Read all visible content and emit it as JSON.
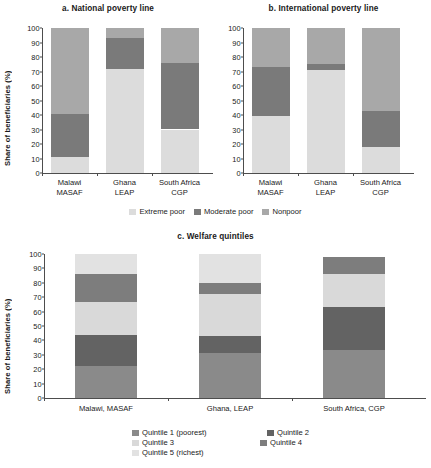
{
  "figure": {
    "ylabel": "Share of beneficiaries (%)",
    "yticks": [
      0,
      10,
      20,
      30,
      40,
      50,
      60,
      70,
      80,
      90,
      100
    ]
  },
  "colors": {
    "extreme_poor": "#dcdcdc",
    "moderate_poor": "#7a7a7a",
    "nonpoor": "#a8a8a8",
    "quintile1": "#8a8a8a",
    "quintile2": "#636363",
    "quintile3": "#d9d9d9",
    "quintile4": "#7d7d7d",
    "quintile5": "#e2e2e2",
    "axis": "#4d4d4d",
    "text": "#1a1a1a"
  },
  "poverty_legend": {
    "items": [
      {
        "label": "Extreme poor",
        "color_key": "extreme_poor"
      },
      {
        "label": "Moderate poor",
        "color_key": "moderate_poor"
      },
      {
        "label": "Nonpoor",
        "color_key": "nonpoor"
      }
    ]
  },
  "quintile_legend": {
    "items": [
      {
        "label": "Quintile 1 (poorest)",
        "color_key": "quintile1"
      },
      {
        "label": "Quintile 2",
        "color_key": "quintile2"
      },
      {
        "label": "Quintile 3",
        "color_key": "quintile3"
      },
      {
        "label": "Quintile 4",
        "color_key": "quintile4"
      },
      {
        "label": "Quintile 5 (richest)",
        "color_key": "quintile5"
      }
    ]
  },
  "chart_data": [
    {
      "type": "bar",
      "stacked": true,
      "panel": "a",
      "title": "a. National poverty line",
      "categories": [
        "Malawi\nMASAF",
        "Ghana\nLEAP",
        "South Africa\nCGP"
      ],
      "category_lines": [
        [
          "Malawi",
          "MASAF"
        ],
        [
          "Ghana",
          "LEAP"
        ],
        [
          "South Africa",
          "CGP"
        ]
      ],
      "series": [
        {
          "name": "Extreme poor",
          "values": [
            11,
            72,
            30
          ]
        },
        {
          "name": "Moderate poor",
          "values": [
            30,
            21,
            46
          ]
        },
        {
          "name": "Nonpoor",
          "values": [
            59,
            7,
            24
          ]
        }
      ],
      "xlabel": "",
      "ylabel": "Share of beneficiaries (%)",
      "ylim": [
        0,
        100
      ],
      "ytick_step": 10,
      "grid": false,
      "legend_position": "bottom"
    },
    {
      "type": "bar",
      "stacked": true,
      "panel": "b",
      "title": "b. International poverty line",
      "categories": [
        "Malawi\nMASAF",
        "Ghana\nLEAP",
        "South Africa\nCGP"
      ],
      "category_lines": [
        [
          "Malawi",
          "MASAF"
        ],
        [
          "Ghana",
          "LEAP"
        ],
        [
          "South Africa",
          "CGP"
        ]
      ],
      "series": [
        {
          "name": "Extreme poor",
          "values": [
            39,
            71,
            18
          ]
        },
        {
          "name": "Moderate poor",
          "values": [
            34,
            4,
            25
          ]
        },
        {
          "name": "Nonpoor",
          "values": [
            27,
            25,
            57
          ]
        }
      ],
      "xlabel": "",
      "ylabel": "Share of beneficiaries (%)",
      "ylim": [
        0,
        100
      ],
      "ytick_step": 10,
      "grid": false,
      "legend_position": "bottom"
    },
    {
      "type": "bar",
      "stacked": true,
      "panel": "c",
      "title": "c. Welfare quintiles",
      "categories": [
        "Malawi, MASAF",
        "Ghana, LEAP",
        "South Africa, CGP"
      ],
      "category_lines": [
        [
          "Malawi, MASAF"
        ],
        [
          "Ghana, LEAP"
        ],
        [
          "South Africa, CGP"
        ]
      ],
      "series": [
        {
          "name": "Quintile 1 (poorest)",
          "values": [
            22,
            31,
            33
          ]
        },
        {
          "name": "Quintile 2",
          "values": [
            22,
            12,
            30
          ]
        },
        {
          "name": "Quintile 3",
          "values": [
            23,
            29,
            23
          ]
        },
        {
          "name": "Quintile 4",
          "values": [
            19,
            8,
            12
          ]
        },
        {
          "name": "Quintile 5 (richest)",
          "values": [
            14,
            20,
            0
          ]
        }
      ],
      "xlabel": "",
      "ylabel": "Share of beneficiaries (%)",
      "ylim": [
        0,
        100
      ],
      "ytick_step": 10,
      "grid": false,
      "legend_position": "bottom"
    }
  ]
}
